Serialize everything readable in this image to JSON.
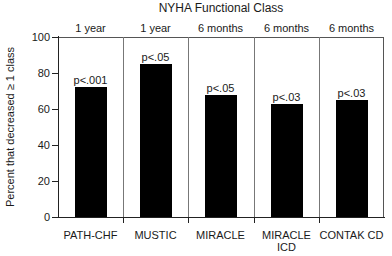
{
  "chart_data": {
    "type": "bar",
    "title": "NYHA Functional Class",
    "xlabel": "",
    "ylabel": "Percent that decreased ≥ 1 class",
    "ylim": [
      0,
      100
    ],
    "yticks": [
      0,
      20,
      40,
      60,
      80,
      100
    ],
    "grid": false,
    "legend": null,
    "categories": [
      "PATH-CHF",
      "MUSTIC",
      "MIRACLE",
      "MIRACLE ICD",
      "CONTAK CD"
    ],
    "values": [
      72,
      85,
      68,
      63,
      65
    ],
    "follow_up": [
      "1 year",
      "1 year",
      "6 months",
      "6 months",
      "6 months"
    ],
    "annotations": [
      "p<.001",
      "p<.05",
      "p<.05",
      "p<.03",
      "p<.03"
    ],
    "bar_color": "#000000"
  },
  "labels": {
    "title": "NYHA Functional Class",
    "ylabel": "Percent that decreased ≥ 1 class",
    "yticks": [
      "0",
      "20",
      "40",
      "60",
      "80",
      "100"
    ],
    "panels": [
      {
        "period": "1 year",
        "p": "p<.001",
        "name": "PATH-CHF"
      },
      {
        "period": "1 year",
        "p": "p<.05",
        "name": "MUSTIC"
      },
      {
        "period": "6 months",
        "p": "p<.05",
        "name": "MIRACLE"
      },
      {
        "period": "6 months",
        "p": "p<.03",
        "name": "MIRACLE ICD"
      },
      {
        "period": "6 months",
        "p": "p<.03",
        "name": "CONTAK CD"
      }
    ]
  }
}
